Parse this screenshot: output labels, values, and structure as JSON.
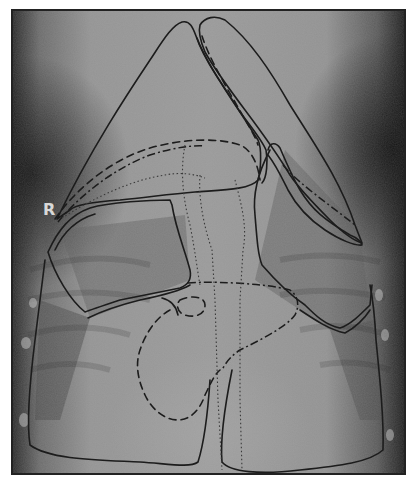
{
  "figure": {
    "type": "radiograph",
    "side_marker": "R",
    "colors": {
      "background": "#ffffff",
      "film_base": "#8e8e8e",
      "film_dark": "#1e1e1e",
      "frame": "#222222",
      "outline": "#1c1c1c"
    },
    "overlays": [
      {
        "name": "cranial-lung-lobe-left",
        "style": "solid"
      },
      {
        "name": "cranial-lung-lobe-right",
        "style": "solid"
      },
      {
        "name": "middle-lobe-left",
        "style": "solid"
      },
      {
        "name": "middle-lobe-right",
        "style": "solid"
      },
      {
        "name": "caudal-lobe-left",
        "style": "solid"
      },
      {
        "name": "caudal-lobe-right",
        "style": "solid"
      },
      {
        "name": "heart-silhouette",
        "style": "dashed"
      },
      {
        "name": "aortic-arch",
        "style": "dashed"
      },
      {
        "name": "diaphragm-line",
        "style": "dash-dot"
      },
      {
        "name": "trachea",
        "style": "dotted"
      },
      {
        "name": "esophagus",
        "style": "dotted"
      }
    ]
  }
}
